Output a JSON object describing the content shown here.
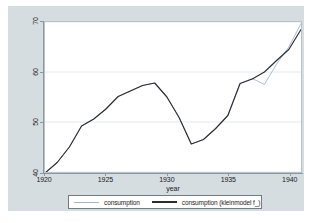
{
  "chart_data": {
    "type": "line",
    "title": "",
    "xlabel": "year",
    "ylabel": "",
    "xlim": [
      1920,
      1941
    ],
    "ylim": [
      40,
      70
    ],
    "xticks": [
      "1920",
      "1925",
      "1930",
      "1935",
      "1940"
    ],
    "xtick_values": [
      1920,
      1925,
      1930,
      1935,
      1940
    ],
    "yticks": [
      "40",
      "50",
      "60",
      "70"
    ],
    "ytick_values": [
      40,
      50,
      60,
      70
    ],
    "grid": "horizontal",
    "legend_position": "bottom",
    "x": [
      1920,
      1921,
      1922,
      1923,
      1924,
      1925,
      1926,
      1927,
      1928,
      1929,
      1930,
      1931,
      1932,
      1933,
      1934,
      1935,
      1936,
      1937,
      1938,
      1939,
      1940,
      1941
    ],
    "series": [
      {
        "name": "consumption",
        "color": "#9fb8cc",
        "values": [
          39.8,
          41.9,
          45.0,
          49.2,
          50.6,
          52.6,
          55.1,
          56.2,
          57.3,
          57.8,
          55.0,
          50.9,
          45.6,
          46.5,
          48.7,
          51.3,
          57.7,
          58.7,
          57.5,
          61.6,
          65.0,
          69.7
        ]
      },
      {
        "name": "consumption (kleinmodel f_)",
        "color": "#2b2b33",
        "values": [
          39.8,
          41.9,
          45.0,
          49.2,
          50.6,
          52.6,
          55.1,
          56.2,
          57.3,
          57.8,
          55.0,
          50.9,
          45.6,
          46.5,
          48.7,
          51.3,
          57.7,
          58.6,
          60.0,
          62.3,
          64.5,
          68.5
        ]
      }
    ]
  },
  "legend": {
    "items": [
      {
        "label": "consumption",
        "key": "legend-key-consumption"
      },
      {
        "label": "consumption (kleinmodel f_)",
        "key": "legend-key-consumption-fitted"
      }
    ]
  },
  "axes": {
    "x_title": "year"
  }
}
